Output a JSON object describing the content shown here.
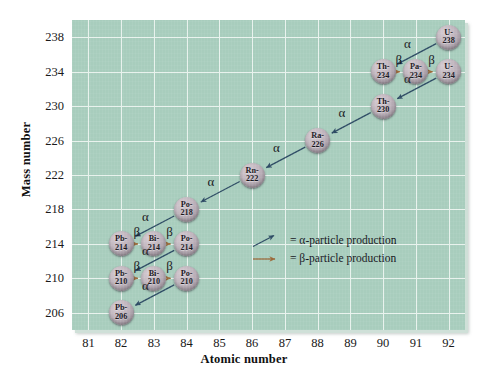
{
  "chart_data": {
    "type": "scatter",
    "title": "",
    "xlabel": "Atomic number",
    "ylabel": "Mass number",
    "xlim": [
      80.5,
      92.5
    ],
    "ylim": [
      204,
      240
    ],
    "xticks": [
      81,
      82,
      83,
      84,
      85,
      86,
      87,
      88,
      89,
      90,
      91,
      92
    ],
    "yticks": [
      206,
      210,
      214,
      218,
      222,
      226,
      230,
      234,
      238
    ],
    "grid": true,
    "legend_position": "inside-center",
    "nodes": [
      {
        "label": "U-238",
        "element": "U",
        "mass": "238",
        "x": 92,
        "y": 238
      },
      {
        "label": "Th-234",
        "element": "Th",
        "mass": "234",
        "x": 90,
        "y": 234
      },
      {
        "label": "Pa-234",
        "element": "Pa",
        "mass": "234",
        "x": 91,
        "y": 234
      },
      {
        "label": "U-234",
        "element": "U",
        "mass": "234",
        "x": 92,
        "y": 234
      },
      {
        "label": "Th-230",
        "element": "Th",
        "mass": "230",
        "x": 90,
        "y": 230
      },
      {
        "label": "Ra-226",
        "element": "Ra",
        "mass": "226",
        "x": 88,
        "y": 226
      },
      {
        "label": "Rn-222",
        "element": "Rn",
        "mass": "222",
        "x": 86,
        "y": 222
      },
      {
        "label": "Po-218",
        "element": "Po",
        "mass": "218",
        "x": 84,
        "y": 218
      },
      {
        "label": "Pb-214",
        "element": "Pb",
        "mass": "214",
        "x": 82,
        "y": 214
      },
      {
        "label": "Bi-214",
        "element": "Bi",
        "mass": "214",
        "x": 83,
        "y": 214
      },
      {
        "label": "Po-214",
        "element": "Po",
        "mass": "214",
        "x": 84,
        "y": 214
      },
      {
        "label": "Pb-210",
        "element": "Pb",
        "mass": "210",
        "x": 82,
        "y": 210
      },
      {
        "label": "Bi-210",
        "element": "Bi",
        "mass": "210",
        "x": 83,
        "y": 210
      },
      {
        "label": "Po-210",
        "element": "Po",
        "mass": "210",
        "x": 84,
        "y": 210
      },
      {
        "label": "Pb-206",
        "element": "Pb",
        "mass": "206",
        "x": 82,
        "y": 206
      }
    ],
    "decays": [
      {
        "from": "U-238",
        "to": "Th-234",
        "type": "alpha",
        "symbol": "α"
      },
      {
        "from": "Th-234",
        "to": "Pa-234",
        "type": "beta",
        "symbol": "β"
      },
      {
        "from": "Pa-234",
        "to": "U-234",
        "type": "beta",
        "symbol": "β"
      },
      {
        "from": "U-234",
        "to": "Th-230",
        "type": "alpha",
        "symbol": "α"
      },
      {
        "from": "Th-230",
        "to": "Ra-226",
        "type": "alpha",
        "symbol": "α"
      },
      {
        "from": "Ra-226",
        "to": "Rn-222",
        "type": "alpha",
        "symbol": "α"
      },
      {
        "from": "Rn-222",
        "to": "Po-218",
        "type": "alpha",
        "symbol": "α"
      },
      {
        "from": "Po-218",
        "to": "Pb-214",
        "type": "alpha",
        "symbol": "α"
      },
      {
        "from": "Pb-214",
        "to": "Bi-214",
        "type": "beta",
        "symbol": "β"
      },
      {
        "from": "Bi-214",
        "to": "Po-214",
        "type": "beta",
        "symbol": "β"
      },
      {
        "from": "Po-214",
        "to": "Pb-210",
        "type": "alpha",
        "symbol": "α"
      },
      {
        "from": "Pb-210",
        "to": "Bi-210",
        "type": "beta",
        "symbol": "β"
      },
      {
        "from": "Bi-210",
        "to": "Po-210",
        "type": "beta",
        "symbol": "β"
      },
      {
        "from": "Po-210",
        "to": "Pb-206",
        "type": "alpha",
        "symbol": "α"
      }
    ],
    "legend": [
      {
        "symbol": "alpha-arrow",
        "text": "= α-particle production"
      },
      {
        "symbol": "beta-arrow",
        "text": "= β-particle production"
      }
    ]
  },
  "colors": {
    "panel_background": "#a8cdbd",
    "gridline": "#e8f2ed",
    "alpha_arrow": "#2c4a63",
    "beta_arrow": "#9a6a3a",
    "node_fill": "#bdb2bb",
    "text": "#15151a",
    "page_background": "#ffffff"
  }
}
